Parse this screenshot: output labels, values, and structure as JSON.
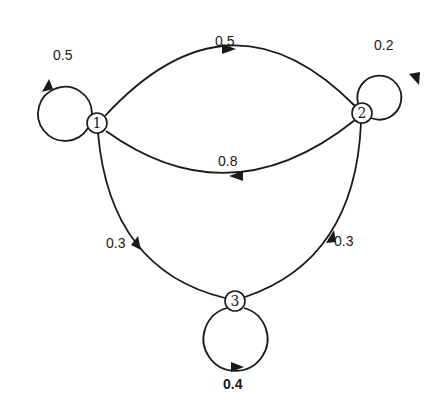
{
  "diagram": {
    "type": "markov-chain-state-diagram",
    "nodes": [
      {
        "id": "1",
        "label": "1",
        "x": 97,
        "y": 123
      },
      {
        "id": "2",
        "label": "2",
        "x": 362,
        "y": 113
      },
      {
        "id": "3",
        "label": "3",
        "x": 235,
        "y": 301
      }
    ],
    "edges": [
      {
        "from": "1",
        "to": "1",
        "label": "0.5"
      },
      {
        "from": "1",
        "to": "2",
        "label": "0.5"
      },
      {
        "from": "2",
        "to": "2",
        "label": "0.2"
      },
      {
        "from": "2",
        "to": "1",
        "label": "0.8"
      },
      {
        "from": "3",
        "to": "1",
        "label": "0.3"
      },
      {
        "from": "3",
        "to": "2",
        "label": "0.3"
      },
      {
        "from": "3",
        "to": "3",
        "label": "0.4"
      }
    ]
  },
  "labels": {
    "loop11": "0.5",
    "e12": "0.5",
    "loop22": "0.2",
    "e21": "0.8",
    "e31": "0.3",
    "e32": "0.3",
    "loop33": "0.4"
  },
  "colors": {
    "stroke": "#1a1a1a",
    "background": "#ffffff"
  }
}
